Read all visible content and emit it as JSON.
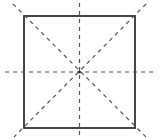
{
  "diagram": {
    "shape": "square",
    "symmetry_lines": [
      "vertical",
      "horizontal",
      "diagonal-main",
      "diagonal-anti"
    ],
    "colors": {
      "square_stroke": "#333333",
      "dashed_line": "#555555",
      "background": "#ffffff"
    }
  }
}
